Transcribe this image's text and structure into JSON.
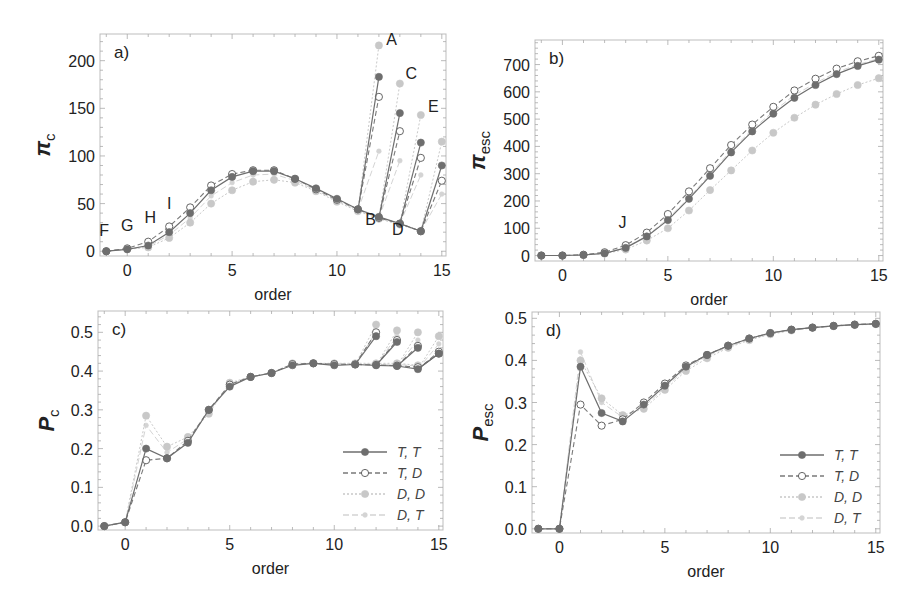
{
  "figure": {
    "x_label": "order",
    "legend": [
      {
        "label": "T,  T",
        "key": "TT"
      },
      {
        "label": "T,  D",
        "key": "TD"
      },
      {
        "label": "D,  D",
        "key": "DD"
      },
      {
        "label": "D,  T",
        "key": "DT"
      }
    ],
    "series_styles": {
      "TT": {
        "color": "#6e6e6e",
        "dash": "",
        "marker": "filled",
        "width": 1.2
      },
      "TD": {
        "color": "#7a7a7a",
        "dash": "5,3",
        "marker": "open",
        "width": 1.1
      },
      "DD": {
        "color": "#c8c8c8",
        "dash": "2,2",
        "marker": "filled",
        "width": 1.0
      },
      "DT": {
        "color": "#d4d4d4",
        "dash": "6,3",
        "marker": "small",
        "width": 1.0
      }
    }
  },
  "chart_data": [
    {
      "panel": "a)",
      "type": "line",
      "ylabel": "π",
      "ylabel_sub": "c",
      "xlabel": "order",
      "xlim": [
        -1.3,
        15.2
      ],
      "ylim": [
        -5,
        228
      ],
      "xticks": [
        0,
        5,
        10,
        15
      ],
      "yticks": [
        0,
        50,
        100,
        150,
        200
      ],
      "box": {
        "x0": 100,
        "x1": 446,
        "y0": 34,
        "y1": 256
      },
      "series": [
        {
          "name": "T, T",
          "key": "TT",
          "x": [
            -1,
            0,
            1,
            2,
            3,
            4,
            5,
            6,
            7,
            8,
            9,
            10,
            11,
            12,
            13,
            14
          ],
          "y": [
            0,
            2,
            6,
            20,
            40,
            64,
            78,
            84,
            84,
            76,
            66,
            55,
            44,
            36,
            29,
            21
          ]
        },
        {
          "name": "T, D",
          "key": "TD",
          "x": [
            -1,
            0,
            1,
            2,
            3,
            4,
            5,
            6,
            7,
            8,
            9,
            10,
            11,
            12,
            13,
            14
          ],
          "y": [
            0,
            3,
            10,
            26,
            46,
            69,
            81,
            85,
            85,
            76,
            65,
            54,
            44,
            35,
            29,
            21
          ]
        },
        {
          "name": "D, D",
          "key": "DD",
          "x": [
            -1,
            0,
            1,
            2,
            3,
            4,
            5,
            6,
            7,
            8,
            9,
            10,
            11,
            12,
            13,
            14
          ],
          "y": [
            0,
            2,
            4,
            14,
            30,
            50,
            64,
            73,
            75,
            72,
            63,
            52,
            42,
            34,
            28,
            21
          ]
        },
        {
          "name": "D, T",
          "key": "DT",
          "x": [
            -1,
            0,
            1,
            2,
            3,
            4,
            5,
            6,
            7,
            8,
            9,
            10,
            11,
            12,
            13,
            14
          ],
          "y": [
            0,
            2,
            5,
            17,
            35,
            58,
            72,
            80,
            81,
            74,
            64,
            53,
            43,
            35,
            29,
            21
          ]
        }
      ],
      "branches": [
        {
          "from_x": 11,
          "from_y": 43,
          "to_x": 12,
          "TT": 183,
          "TD": 162,
          "DD": 216,
          "DT": 105
        },
        {
          "from_x": 12,
          "from_y": 35,
          "to_x": 13,
          "TT": 145,
          "TD": 126,
          "DD": 176,
          "DT": 95
        },
        {
          "from_x": 13,
          "from_y": 29,
          "to_x": 14,
          "TT": 114,
          "TD": 98,
          "DD": 143,
          "DT": 80
        },
        {
          "from_x": 14,
          "from_y": 21,
          "to_x": 15,
          "TT": 90,
          "TD": 74,
          "DD": 115,
          "DT": 60
        }
      ],
      "annotations": [
        {
          "text": "F",
          "x": -1.1,
          "y": 16
        },
        {
          "text": "G",
          "x": 0.0,
          "y": 21
        },
        {
          "text": "H",
          "x": 1.1,
          "y": 30
        },
        {
          "text": "I",
          "x": 2.0,
          "y": 44
        },
        {
          "text": "A",
          "x": 12.6,
          "y": 216
        },
        {
          "text": "C",
          "x": 13.55,
          "y": 181
        },
        {
          "text": "E",
          "x": 14.6,
          "y": 146
        },
        {
          "text": "B",
          "x": 11.6,
          "y": 28
        },
        {
          "text": "D",
          "x": 12.9,
          "y": 17
        }
      ]
    },
    {
      "panel": "b)",
      "type": "line",
      "ylabel": "π",
      "ylabel_sub": "esc",
      "xlabel": "order",
      "xlim": [
        -1.3,
        15.2
      ],
      "ylim": [
        -20,
        790
      ],
      "xticks": [
        0,
        5,
        10,
        15
      ],
      "yticks": [
        0,
        100,
        200,
        300,
        400,
        500,
        600,
        700
      ],
      "box": {
        "x0": 535,
        "x1": 883,
        "y0": 40,
        "y1": 261
      },
      "series": [
        {
          "name": "T, T",
          "key": "TT",
          "x": [
            -1,
            0,
            1,
            2,
            3,
            4,
            5,
            6,
            7,
            8,
            9,
            10,
            11,
            12,
            13,
            14,
            15
          ],
          "y": [
            0,
            0,
            2,
            8,
            28,
            70,
            130,
            208,
            292,
            378,
            455,
            520,
            578,
            625,
            665,
            695,
            718
          ]
        },
        {
          "name": "T, D",
          "key": "TD",
          "x": [
            -1,
            0,
            1,
            2,
            3,
            4,
            5,
            6,
            7,
            8,
            9,
            10,
            11,
            12,
            13,
            14,
            15
          ],
          "y": [
            0,
            0,
            3,
            12,
            38,
            84,
            152,
            235,
            320,
            405,
            480,
            545,
            605,
            648,
            685,
            712,
            732
          ]
        },
        {
          "name": "D, D",
          "key": "DD",
          "x": [
            -1,
            0,
            1,
            2,
            3,
            4,
            5,
            6,
            7,
            8,
            9,
            10,
            11,
            12,
            13,
            14,
            15
          ],
          "y": [
            0,
            0,
            2,
            7,
            22,
            55,
            100,
            165,
            240,
            312,
            385,
            450,
            505,
            553,
            592,
            625,
            650
          ]
        },
        {
          "name": "D, T",
          "key": "DT",
          "x": [
            -1,
            0,
            1,
            2,
            3,
            4,
            5,
            6,
            7,
            8,
            9,
            10,
            11,
            12,
            13,
            14,
            15
          ],
          "y": [
            0,
            0,
            2,
            9,
            30,
            72,
            135,
            212,
            298,
            385,
            462,
            528,
            588,
            632,
            672,
            700,
            722
          ]
        }
      ],
      "branches": [],
      "annotations": [
        {
          "text": "J",
          "x": 2.85,
          "y": 100
        }
      ]
    },
    {
      "panel": "c)",
      "type": "line",
      "ylabel": "P",
      "ylabel_sub": "c",
      "xlabel": "order",
      "xlim": [
        -1.3,
        15.2
      ],
      "ylim": [
        -0.01,
        0.555
      ],
      "xticks": [
        0,
        5,
        10,
        15
      ],
      "yticks": [
        0.0,
        0.1,
        0.2,
        0.3,
        0.4,
        0.5
      ],
      "ytick_format": 1,
      "box": {
        "x0": 98,
        "x1": 443,
        "y0": 311,
        "y1": 530
      },
      "series": [
        {
          "name": "T, T",
          "key": "TT",
          "x": [
            -1,
            0,
            1,
            2,
            3,
            4,
            5,
            6,
            7,
            8,
            9,
            10,
            11,
            12,
            13,
            14,
            15
          ],
          "y": [
            0.0,
            0.01,
            0.2,
            0.175,
            0.215,
            0.3,
            0.36,
            0.385,
            0.395,
            0.415,
            0.42,
            0.415,
            0.417,
            0.415,
            0.413,
            0.405,
            0.445
          ]
        },
        {
          "name": "T, D",
          "key": "TD",
          "x": [
            -1,
            0,
            1,
            2,
            3,
            4,
            5,
            6,
            7,
            8,
            9,
            10,
            11,
            12,
            13,
            14
          ],
          "y": [
            0.0,
            0.01,
            0.17,
            0.175,
            0.22,
            0.3,
            0.365,
            0.385,
            0.395,
            0.418,
            0.42,
            0.418,
            0.417,
            0.416,
            0.414,
            0.41
          ]
        },
        {
          "name": "D, D",
          "key": "DD",
          "x": [
            -1,
            0,
            1,
            2,
            3,
            4,
            5,
            6,
            7,
            8,
            9,
            10,
            11,
            12,
            13,
            14
          ],
          "y": [
            0.0,
            0.01,
            0.285,
            0.205,
            0.23,
            0.29,
            0.37,
            0.385,
            0.395,
            0.42,
            0.42,
            0.42,
            0.42,
            0.42,
            0.42,
            0.415
          ]
        },
        {
          "name": "D, T",
          "key": "DT",
          "x": [
            -1,
            0,
            1,
            2,
            3,
            4,
            5,
            6,
            7,
            8,
            9,
            10,
            11,
            12,
            13,
            14
          ],
          "y": [
            0.0,
            0.01,
            0.26,
            0.19,
            0.225,
            0.295,
            0.365,
            0.385,
            0.395,
            0.418,
            0.42,
            0.419,
            0.418,
            0.418,
            0.417,
            0.413
          ]
        }
      ],
      "branches": [
        {
          "from_x": 11,
          "from_y": 0.417,
          "to_x": 12,
          "TT": 0.49,
          "TD": 0.5,
          "DD": 0.52,
          "DT": 0.5
        },
        {
          "from_x": 12,
          "from_y": 0.415,
          "to_x": 13,
          "TT": 0.475,
          "TD": 0.48,
          "DD": 0.505,
          "DT": 0.49
        },
        {
          "from_x": 13,
          "from_y": 0.413,
          "to_x": 14,
          "TT": 0.46,
          "TD": 0.465,
          "DD": 0.5,
          "DT": 0.48
        },
        {
          "from_x": 14,
          "from_y": 0.405,
          "to_x": 15,
          "TT": 0.445,
          "TD": 0.45,
          "DD": 0.49,
          "DT": 0.47
        }
      ],
      "annotations": []
    },
    {
      "panel": "d)",
      "type": "line",
      "ylabel": "P",
      "ylabel_sub": "esc",
      "xlabel": "order",
      "xlim": [
        -1.3,
        15.2
      ],
      "ylim": [
        -0.01,
        0.515
      ],
      "xticks": [
        0,
        5,
        10,
        15
      ],
      "yticks": [
        0.0,
        0.1,
        0.2,
        0.3,
        0.4,
        0.5
      ],
      "ytick_format": 1,
      "box": {
        "x0": 532,
        "x1": 880,
        "y0": 312,
        "y1": 533
      },
      "series": [
        {
          "name": "T, T",
          "key": "TT",
          "x": [
            -1,
            0,
            1,
            2,
            3,
            4,
            5,
            6,
            7,
            8,
            9,
            10,
            11,
            12,
            13,
            14,
            15
          ],
          "y": [
            0.0,
            0.0,
            0.385,
            0.275,
            0.255,
            0.295,
            0.34,
            0.385,
            0.413,
            0.435,
            0.452,
            0.465,
            0.473,
            0.478,
            0.482,
            0.485,
            0.487
          ]
        },
        {
          "name": "T, D",
          "key": "TD",
          "x": [
            -1,
            0,
            1,
            2,
            3,
            4,
            5,
            6,
            7,
            8,
            9,
            10,
            11,
            12,
            13,
            14,
            15
          ],
          "y": [
            0.0,
            0.0,
            0.295,
            0.245,
            0.26,
            0.3,
            0.345,
            0.388,
            0.413,
            0.435,
            0.452,
            0.465,
            0.473,
            0.478,
            0.482,
            0.485,
            0.487
          ]
        },
        {
          "name": "D, D",
          "key": "DD",
          "x": [
            -1,
            0,
            1,
            2,
            3,
            4,
            5,
            6,
            7,
            8,
            9,
            10,
            11,
            12,
            13,
            14,
            15
          ],
          "y": [
            0.0,
            0.0,
            0.4,
            0.31,
            0.27,
            0.285,
            0.33,
            0.375,
            0.405,
            0.43,
            0.448,
            0.462,
            0.471,
            0.477,
            0.481,
            0.484,
            0.486
          ]
        },
        {
          "name": "D, T",
          "key": "DT",
          "x": [
            -1,
            0,
            1,
            2,
            3,
            4,
            5,
            6,
            7,
            8,
            9,
            10,
            11,
            12,
            13,
            14,
            15
          ],
          "y": [
            0.0,
            0.0,
            0.42,
            0.3,
            0.265,
            0.29,
            0.335,
            0.38,
            0.41,
            0.432,
            0.45,
            0.463,
            0.472,
            0.478,
            0.482,
            0.485,
            0.487
          ]
        }
      ],
      "branches": [],
      "annotations": []
    }
  ]
}
